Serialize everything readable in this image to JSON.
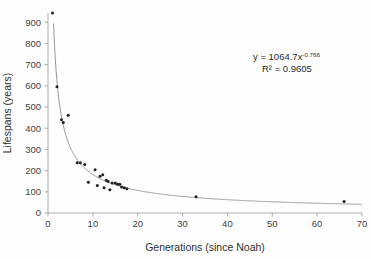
{
  "chart_data": {
    "type": "scatter",
    "title": "",
    "xlabel": "Generations (since Noah)",
    "ylabel": "Lifespans (years)",
    "xlim": [
      0,
      70
    ],
    "ylim": [
      0,
      950
    ],
    "xticks": [
      0,
      10,
      20,
      30,
      40,
      50,
      60,
      70
    ],
    "yticks": [
      0,
      100,
      200,
      300,
      400,
      500,
      600,
      700,
      800,
      900
    ],
    "grid": false,
    "legend": null,
    "annotations": {
      "equation_base": "y = 1064.7x",
      "equation_exponent": "-0.766",
      "r_squared": "R² = 0.9605"
    },
    "fit": {
      "kind": "power",
      "coefficient": 1064.7,
      "exponent": -0.766,
      "r2": 0.9605
    },
    "points": [
      {
        "x": 1,
        "y": 950
      },
      {
        "x": 2,
        "y": 600
      },
      {
        "x": 3,
        "y": 443
      },
      {
        "x": 3.4,
        "y": 430
      },
      {
        "x": 4.5,
        "y": 464
      },
      {
        "x": 6.5,
        "y": 239
      },
      {
        "x": 7.2,
        "y": 239
      },
      {
        "x": 8.2,
        "y": 230
      },
      {
        "x": 9,
        "y": 146
      },
      {
        "x": 10.5,
        "y": 205
      },
      {
        "x": 11,
        "y": 131
      },
      {
        "x": 11.6,
        "y": 175
      },
      {
        "x": 12.2,
        "y": 182
      },
      {
        "x": 12.5,
        "y": 120
      },
      {
        "x": 13,
        "y": 155
      },
      {
        "x": 13.4,
        "y": 150
      },
      {
        "x": 13.8,
        "y": 110
      },
      {
        "x": 14.3,
        "y": 143
      },
      {
        "x": 15,
        "y": 143
      },
      {
        "x": 15.5,
        "y": 137
      },
      {
        "x": 16,
        "y": 137
      },
      {
        "x": 16.4,
        "y": 123
      },
      {
        "x": 17,
        "y": 120
      },
      {
        "x": 17.6,
        "y": 115
      },
      {
        "x": 33,
        "y": 77
      },
      {
        "x": 66,
        "y": 55
      }
    ]
  },
  "axes": {
    "y_tick_labels": [
      "0",
      "100",
      "200",
      "300",
      "400",
      "500",
      "600",
      "700",
      "800",
      "900"
    ],
    "x_tick_labels": [
      "0",
      "10",
      "20",
      "30",
      "40",
      "50",
      "60",
      "70"
    ]
  }
}
